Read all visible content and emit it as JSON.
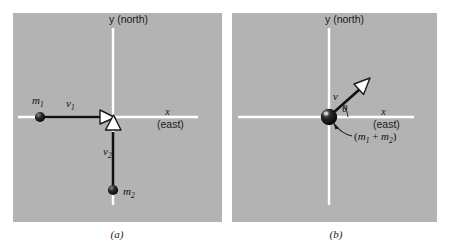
{
  "figure": {
    "type": "physics-vector-diagram",
    "background_color": "#ffffff",
    "panel_fill_color": "#b3b3b3",
    "axis_color": "#ffffff",
    "vector_color": "#111111",
    "arrowhead_fill": "#ffffff",
    "mass_color": "#0d0d0d"
  },
  "panel_a": {
    "caption": "(a)",
    "axes": {
      "y_label": "y (north)",
      "x_letter": "x",
      "x_sub_label": "(east)"
    },
    "labels": {
      "mass1": {
        "symbol": "m",
        "subscript": "1"
      },
      "mass2": {
        "symbol": "m",
        "subscript": "2"
      },
      "velocity1": {
        "symbol": "v",
        "subscript": "1"
      },
      "velocity2": {
        "symbol": "v",
        "subscript": "2"
      }
    }
  },
  "panel_b": {
    "caption": "(b)",
    "axes": {
      "y_label": "y (north)",
      "x_letter": "x",
      "x_sub_label": "(east)"
    },
    "labels": {
      "velocity": {
        "symbol": "v"
      },
      "angle": {
        "symbol": "θ"
      },
      "combined_mass": {
        "open": "(",
        "m1": "m",
        "m1_sub": "1",
        "operator": " + ",
        "m2": "m",
        "m2_sub": "2",
        "close": ")"
      }
    }
  }
}
